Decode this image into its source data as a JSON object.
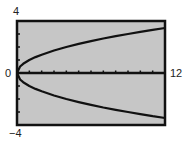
{
  "chart_data": {
    "type": "line",
    "title": "",
    "xlabel": "",
    "ylabel": "",
    "xlim": [
      0,
      12
    ],
    "ylim": [
      -4,
      4
    ],
    "x_tick_step": 1,
    "y_tick_step": 1,
    "grid": false,
    "legend": null,
    "axis_labels": {
      "xmin": "0",
      "xmax": "12",
      "ymax": "4",
      "ymin": "-4"
    },
    "series": [
      {
        "name": "upper branch",
        "x": [
          0,
          0.25,
          0.5,
          1,
          1.5,
          2,
          3,
          4,
          5,
          6,
          7,
          8,
          9,
          10,
          11,
          12
        ],
        "values": [
          0,
          0.5,
          0.71,
          1.0,
          1.22,
          1.41,
          1.73,
          2.0,
          2.24,
          2.45,
          2.65,
          2.83,
          3.0,
          3.16,
          3.32,
          3.46
        ]
      },
      {
        "name": "lower branch",
        "x": [
          0,
          0.25,
          0.5,
          1,
          1.5,
          2,
          3,
          4,
          5,
          6,
          7,
          8,
          9,
          10,
          11,
          12
        ],
        "values": [
          0,
          -0.5,
          -0.71,
          -1.0,
          -1.22,
          -1.41,
          -1.73,
          -2.0,
          -2.24,
          -2.45,
          -2.65,
          -2.83,
          -3.0,
          -3.16,
          -3.32,
          -3.46
        ]
      }
    ]
  },
  "style": {
    "plot_bg": "#c6c6c6",
    "frame_color": "#111111",
    "curve_color": "#111111"
  }
}
